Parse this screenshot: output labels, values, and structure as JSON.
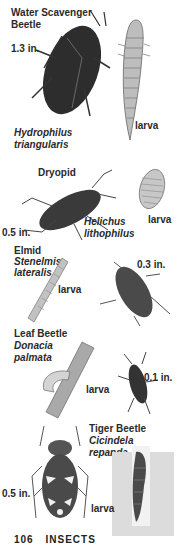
{
  "page": {
    "number": "106",
    "section": "INSECTS"
  },
  "entries": [
    {
      "common_name": "Water Scavenger Beetle",
      "common_name_line1": "Water Scavenger",
      "common_name_line2": "Beetle",
      "size": "1.3 in.",
      "genus": "Hydrophilus",
      "species": "triangularis",
      "larva_label": "larva"
    },
    {
      "common_name": "Dryopid",
      "size": "0.5 in.",
      "genus": "Helichus",
      "species": "lithophilus",
      "larva_label": "larva"
    },
    {
      "common_name": "Elmid",
      "genus": "Stenelmis",
      "species": "lateralis",
      "size": "0.3 in.",
      "larva_label": "larva"
    },
    {
      "common_name": "Leaf Beetle",
      "genus": "Donacia",
      "species": "palmata",
      "size": "0.1 in.",
      "larva_label": "larva"
    },
    {
      "common_name": "Tiger Beetle",
      "genus": "Cicindela",
      "species": "repanda",
      "size": "0.5 in.",
      "larva_label": "larva"
    }
  ]
}
